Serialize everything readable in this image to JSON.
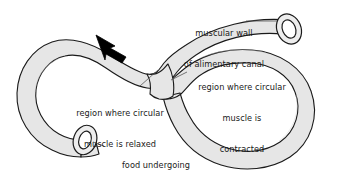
{
  "figure": {
    "background_color": "#ffffff",
    "tube_fill_color": "#e6e6e6",
    "tube_stroke_color": "#1a1a1a",
    "lumen_fill_color": "#ffffff",
    "text_color": "#1a1a1a",
    "leader_line_color": "#555555",
    "arrow_color": "#000000"
  },
  "labels": {
    "muscular_wall": {
      "line1": "muscular wall",
      "line2": "of alimentary canal"
    },
    "contracted": {
      "line1": "region where circular",
      "line2": "muscle is",
      "line3": "contracted"
    },
    "relaxed": {
      "line1": "region where circular",
      "line2": "muscle is relaxed"
    },
    "food": {
      "line1": "food undergoing",
      "line2": "digestion"
    }
  },
  "annotations": {
    "flow_arrow": "arrow indicating direction of food movement"
  }
}
